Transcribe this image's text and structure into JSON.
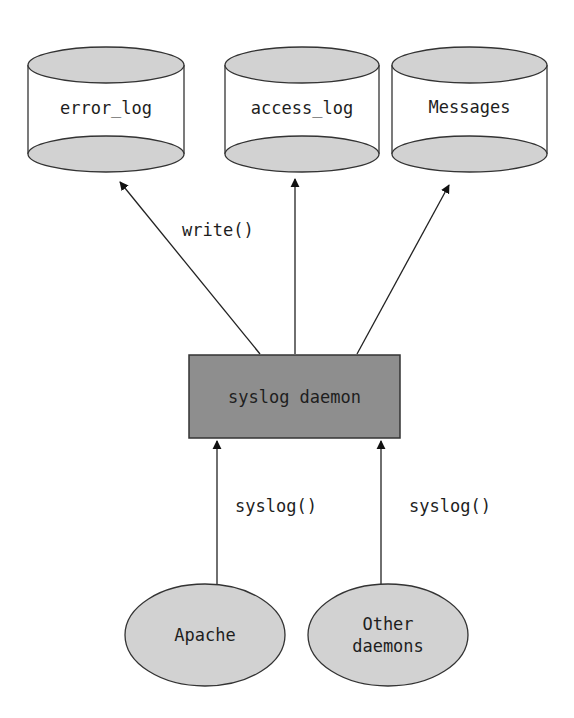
{
  "diagram": {
    "stores": [
      {
        "label": "error_log"
      },
      {
        "label": "access_log"
      },
      {
        "label": "Messages"
      }
    ],
    "daemon": {
      "label": "syslog daemon"
    },
    "edges": {
      "write_label": "write()",
      "syslog_left_label": "syslog()",
      "syslog_right_label": "syslog()"
    },
    "sources": [
      {
        "label": "Apache"
      },
      {
        "label_line1": "Other",
        "label_line2": "daemons"
      }
    ],
    "colors": {
      "fill_gray": "#d2d2d2",
      "box_gray": "#8e8e8e",
      "stroke": "#333333"
    }
  }
}
